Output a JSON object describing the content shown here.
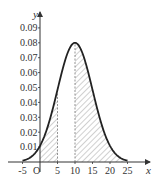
{
  "chart_data": {
    "type": "line",
    "title": "",
    "xlabel": "x",
    "ylabel": "y",
    "origin_label": "O",
    "xlim": [
      -5,
      27
    ],
    "ylim": [
      0,
      0.095
    ],
    "x_ticks": [
      -5,
      5,
      10,
      15,
      20,
      25
    ],
    "x_tick_labels": [
      "-5",
      "5",
      "10",
      "15",
      "20",
      "25"
    ],
    "y_ticks": [
      0.01,
      0.02,
      0.03,
      0.04,
      0.05,
      0.06,
      0.07,
      0.08,
      0.09
    ],
    "y_tick_labels": [
      "0.01",
      "0.02",
      "0.03",
      "0.04",
      "0.05",
      "0.06",
      "0.07",
      "0.08",
      "0.09"
    ],
    "grid": false,
    "legend": null,
    "series": [
      {
        "name": "normal density",
        "mean": 10,
        "sigma": 5,
        "peak": 0.08,
        "x": [
          -5,
          -2.5,
          0,
          2.5,
          5,
          7.5,
          10,
          12.5,
          15,
          17.5,
          20,
          22.5,
          25
        ],
        "values": [
          0.0009,
          0.0035,
          0.0108,
          0.026,
          0.0484,
          0.0704,
          0.0798,
          0.0704,
          0.0484,
          0.026,
          0.0108,
          0.0035,
          0.0009
        ]
      }
    ],
    "shaded_regions": [
      {
        "from": 0,
        "to": 5,
        "style": "hatched"
      },
      {
        "from": 10,
        "to": 25,
        "style": "hatched"
      }
    ],
    "dashed_lines": [
      5,
      10
    ]
  },
  "plot": {
    "px_origin_x": 40,
    "px_origin_y": 162,
    "px_per_x": 3.5,
    "px_per_y": 1490
  }
}
